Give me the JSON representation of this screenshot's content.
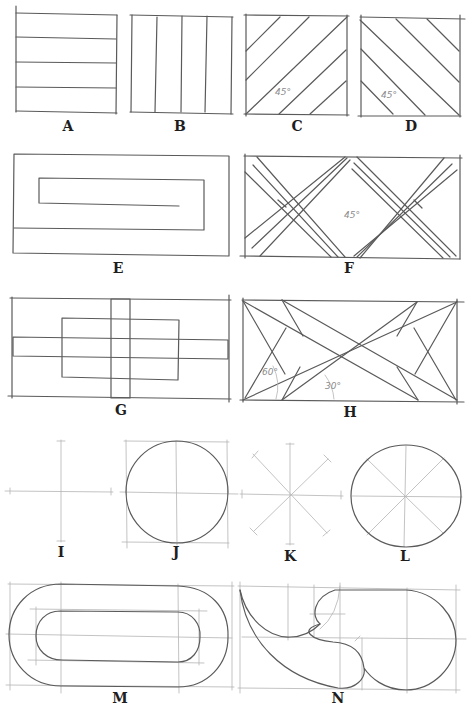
{
  "figure": {
    "ink_color": "#5a5a5a",
    "guide_color": "#b4b4b4",
    "label_color": "#1e1e1e"
  },
  "panels": [
    {
      "id": "A",
      "label": "A",
      "description": "Square with horizontal parallel lines"
    },
    {
      "id": "B",
      "label": "B",
      "description": "Square with vertical parallel lines"
    },
    {
      "id": "C",
      "label": "C",
      "description": "Square with diagonal lines rising left-to-right",
      "angle_label": "45°"
    },
    {
      "id": "D",
      "label": "D",
      "description": "Square with diagonal lines falling left-to-right",
      "angle_label": "45°"
    },
    {
      "id": "E",
      "label": "E",
      "description": "Rectangle with inward spiral/meander"
    },
    {
      "id": "F",
      "label": "F",
      "description": "Rectangle with crossing diagonal double-strips",
      "angle_label": "45°"
    },
    {
      "id": "G",
      "label": "G",
      "description": "Rectangle with overlapping cross and inner rectangle"
    },
    {
      "id": "H",
      "label": "H",
      "description": "Rectangle with radiating diagonal lines",
      "angle_labels": [
        "60°",
        "30°"
      ]
    },
    {
      "id": "I",
      "label": "I",
      "description": "Crosshair axes"
    },
    {
      "id": "J",
      "label": "J",
      "description": "Circle inscribed in square with axes"
    },
    {
      "id": "K",
      "label": "K",
      "description": "Eight-way star of construction lines"
    },
    {
      "id": "L",
      "label": "L",
      "description": "Circle with eight-way construction lines"
    },
    {
      "id": "M",
      "label": "M",
      "description": "Nested rounded-rectangle (stadium) shapes with guides"
    },
    {
      "id": "N",
      "label": "N",
      "description": "Freeform curved shape with construction grid"
    }
  ]
}
